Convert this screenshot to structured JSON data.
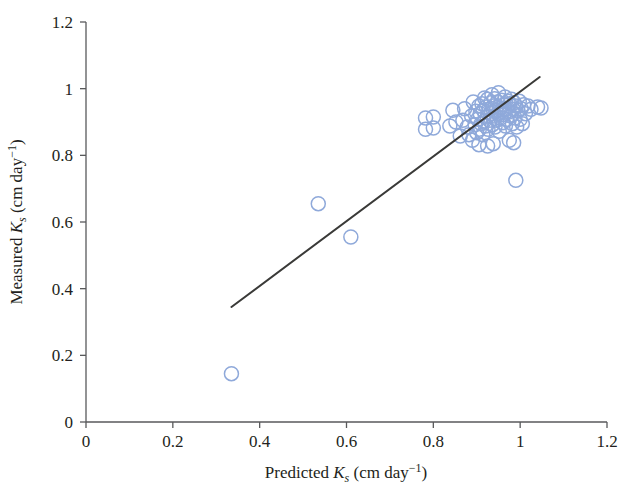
{
  "chart_data": {
    "type": "scatter",
    "title": "",
    "xlabel": "Predicted K_s (cm day^-1)",
    "ylabel": "Measured K_s (cm day^-1)",
    "xlabel_parts": {
      "lead": "Predicted ",
      "sym": "K",
      "sub": "s",
      "unit_open": " (cm day",
      "exp": "−1",
      "unit_close": ")"
    },
    "ylabel_parts": {
      "lead": "Measured ",
      "sym": "K",
      "sub": "s",
      "unit_open": " (cm day",
      "exp": "−1",
      "unit_close": ")"
    },
    "xlim": [
      0,
      1.2
    ],
    "ylim": [
      0,
      1.2
    ],
    "xticks": [
      "0",
      "0.2",
      "0.4",
      "0.6",
      "0.8",
      "1",
      "1.2"
    ],
    "yticks": [
      "0",
      "0.2",
      "0.4",
      "0.6",
      "0.8",
      "1",
      "1.2"
    ],
    "xtick_values": [
      0,
      0.2,
      0.4,
      0.6,
      0.8,
      1,
      1.2
    ],
    "ytick_values": [
      0,
      0.2,
      0.4,
      0.6,
      0.8,
      1,
      1.2
    ],
    "grid": false,
    "legend": null,
    "marker": {
      "shape": "open-circle",
      "stroke_color": "#8fa9da",
      "fill": "none",
      "radius_px": 7
    },
    "fit_line": {
      "x": [
        0.335,
        1.045
      ],
      "y": [
        0.345,
        1.035
      ],
      "color": "#3a3a38"
    },
    "points": [
      [
        0.335,
        0.145
      ],
      [
        0.535,
        0.655
      ],
      [
        0.61,
        0.555
      ],
      [
        0.782,
        0.912
      ],
      [
        0.782,
        0.878
      ],
      [
        0.8,
        0.915
      ],
      [
        0.8,
        0.882
      ],
      [
        0.838,
        0.888
      ],
      [
        0.862,
        0.858
      ],
      [
        0.868,
        0.905
      ],
      [
        0.872,
        0.94
      ],
      [
        0.878,
        0.885
      ],
      [
        0.882,
        0.862
      ],
      [
        0.888,
        0.918
      ],
      [
        0.89,
        0.845
      ],
      [
        0.892,
        0.96
      ],
      [
        0.896,
        0.892
      ],
      [
        0.898,
        0.932
      ],
      [
        0.9,
        0.868
      ],
      [
        0.902,
        0.908
      ],
      [
        0.905,
        0.948
      ],
      [
        0.906,
        0.878
      ],
      [
        0.908,
        0.925
      ],
      [
        0.91,
        0.895
      ],
      [
        0.912,
        0.955
      ],
      [
        0.914,
        0.862
      ],
      [
        0.915,
        0.935
      ],
      [
        0.917,
        0.902
      ],
      [
        0.918,
        0.972
      ],
      [
        0.92,
        0.888
      ],
      [
        0.922,
        0.945
      ],
      [
        0.924,
        0.915
      ],
      [
        0.925,
        0.968
      ],
      [
        0.926,
        0.878
      ],
      [
        0.928,
        0.938
      ],
      [
        0.93,
        0.905
      ],
      [
        0.932,
        0.958
      ],
      [
        0.934,
        0.925
      ],
      [
        0.935,
        0.982
      ],
      [
        0.936,
        0.892
      ],
      [
        0.938,
        0.948
      ],
      [
        0.94,
        0.918
      ],
      [
        0.941,
        0.97
      ],
      [
        0.942,
        0.885
      ],
      [
        0.944,
        0.935
      ],
      [
        0.946,
        0.905
      ],
      [
        0.948,
        0.96
      ],
      [
        0.949,
        0.925
      ],
      [
        0.95,
        0.988
      ],
      [
        0.952,
        0.872
      ],
      [
        0.954,
        0.942
      ],
      [
        0.955,
        0.912
      ],
      [
        0.957,
        0.965
      ],
      [
        0.958,
        0.932
      ],
      [
        0.96,
        0.898
      ],
      [
        0.962,
        0.952
      ],
      [
        0.963,
        0.922
      ],
      [
        0.965,
        0.975
      ],
      [
        0.966,
        0.888
      ],
      [
        0.968,
        0.94
      ],
      [
        0.97,
        0.908
      ],
      [
        0.972,
        0.962
      ],
      [
        0.974,
        0.93
      ],
      [
        0.975,
        0.845
      ],
      [
        0.976,
        0.955
      ],
      [
        0.978,
        0.918
      ],
      [
        0.98,
        0.968
      ],
      [
        0.982,
        0.895
      ],
      [
        0.984,
        0.938
      ],
      [
        0.985,
        0.838
      ],
      [
        0.986,
        0.958
      ],
      [
        0.988,
        0.912
      ],
      [
        0.99,
        0.948
      ],
      [
        0.99,
        0.725
      ],
      [
        0.992,
        0.885
      ],
      [
        0.995,
        0.935
      ],
      [
        0.998,
        0.962
      ],
      [
        1.0,
        0.908
      ],
      [
        1.002,
        0.94
      ],
      [
        1.005,
        0.895
      ],
      [
        1.008,
        0.952
      ],
      [
        1.012,
        0.925
      ],
      [
        1.018,
        0.948
      ],
      [
        1.025,
        0.938
      ],
      [
        1.04,
        0.945
      ],
      [
        1.048,
        0.942
      ],
      [
        0.845,
        0.935
      ],
      [
        0.852,
        0.9
      ],
      [
        0.925,
        0.828
      ],
      [
        0.938,
        0.835
      ],
      [
        0.905,
        0.832
      ]
    ]
  },
  "axes": {
    "x_axis_name": "x-axis",
    "y_axis_name": "y-axis"
  }
}
